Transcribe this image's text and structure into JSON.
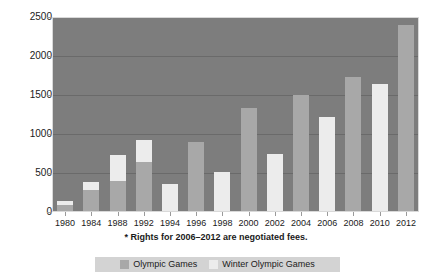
{
  "chart_data": {
    "type": "bar",
    "stacked": true,
    "title": "",
    "subtitle": "",
    "xlabel": "",
    "ylabel": "",
    "ylim": [
      0,
      2500
    ],
    "yticks": [
      0,
      500,
      1000,
      1500,
      2000,
      2500
    ],
    "ytick_labels": [
      "0",
      "500",
      "1000",
      "1500",
      "2000",
      "2500"
    ],
    "grid": true,
    "legend_position": "bottom",
    "categories": [
      "1980",
      "1984",
      "1988",
      "1992",
      "1994",
      "1996",
      "1998",
      "2000",
      "2002",
      "2004",
      "2006",
      "2008",
      "2010",
      "2012"
    ],
    "series": [
      {
        "name": "Olympic Games",
        "color": "#a8a8a8",
        "values": [
          88,
          287,
          403,
          636,
          0,
          898,
          0,
          1332,
          0,
          1494,
          0,
          1737,
          0,
          2400
        ]
      },
      {
        "name": "Winter Olympic Games",
        "color": "#ececec",
        "values": [
          53,
          103,
          325,
          292,
          353,
          0,
          513,
          0,
          738,
          0,
          1217,
          0,
          1640,
          0
        ]
      }
    ],
    "totals": [
      141,
      390,
      728,
      928,
      353,
      898,
      513,
      1332,
      738,
      1494,
      1217,
      1737,
      1640,
      2400
    ],
    "annotations": [
      "* Rights for 2006–2012 are negotiated fees."
    ],
    "plot_background": "#7d7d7d",
    "gridline_color": "#6a6a6a"
  },
  "axes": {
    "y": {
      "ticks": [
        {
          "value": 0,
          "label": "0"
        },
        {
          "value": 500,
          "label": "500"
        },
        {
          "value": 1000,
          "label": "1000"
        },
        {
          "value": 1500,
          "label": "1500"
        },
        {
          "value": 2000,
          "label": "2000"
        },
        {
          "value": 2500,
          "label": "2500"
        }
      ]
    },
    "x": {
      "ticks": [
        {
          "label": "1980"
        },
        {
          "label": "1984"
        },
        {
          "label": "1988"
        },
        {
          "label": "1992"
        },
        {
          "label": "1994"
        },
        {
          "label": "1996"
        },
        {
          "label": "1998"
        },
        {
          "label": "2000"
        },
        {
          "label": "2002"
        },
        {
          "label": "2004"
        },
        {
          "label": "2006"
        },
        {
          "label": "2008"
        },
        {
          "label": "2010"
        },
        {
          "label": "2012"
        }
      ]
    }
  },
  "footnote": {
    "text": "* Rights for 2006–2012 are negotiated fees."
  },
  "legend": {
    "items": [
      {
        "label": "Olympic Games",
        "color": "#a8a8a8"
      },
      {
        "label": "Winter Olympic Games",
        "color": "#ececec"
      }
    ]
  }
}
